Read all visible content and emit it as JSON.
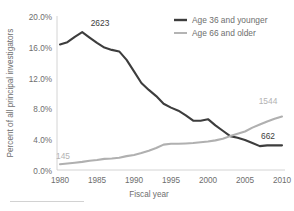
{
  "chart_data": {
    "type": "line",
    "title": "",
    "xlabel": "Fiscal year",
    "ylabel": "Percent of all principal investigators",
    "xlim": [
      1980,
      2010
    ],
    "ylim": [
      0,
      20
    ],
    "grid": false,
    "legend_position": "top-right",
    "x_ticks": [
      "1980",
      "1985",
      "1990",
      "1995",
      "2000",
      "2005",
      "2010"
    ],
    "y_ticks": [
      "0.0%",
      "4.0%",
      "8.0%",
      "12.0%",
      "16.0%",
      "20.0%"
    ],
    "x": [
      1980,
      1981,
      1982,
      1983,
      1984,
      1985,
      1986,
      1987,
      1988,
      1989,
      1990,
      1991,
      1992,
      1993,
      1994,
      1995,
      1996,
      1997,
      1998,
      1999,
      2000,
      2001,
      2002,
      2003,
      2004,
      2005,
      2006,
      2007,
      2008,
      2009,
      2010
    ],
    "series": [
      {
        "name": "Age 36 and younger",
        "color": "#3d3d3d",
        "values": [
          16.3,
          16.6,
          17.3,
          17.9,
          17.2,
          16.5,
          15.9,
          15.6,
          15.4,
          14.3,
          12.8,
          11.3,
          10.4,
          9.6,
          8.6,
          8.1,
          7.7,
          7.1,
          6.4,
          6.4,
          6.6,
          5.8,
          5.1,
          4.4,
          4.2,
          3.9,
          3.5,
          3.1,
          3.2,
          3.2,
          3.2
        ],
        "end_label": "662",
        "peak_label": "2623"
      },
      {
        "name": "Age 66 and older",
        "color": "#b0b0b0",
        "values": [
          0.75,
          0.85,
          0.95,
          1.05,
          1.2,
          1.3,
          1.45,
          1.5,
          1.6,
          1.8,
          1.95,
          2.2,
          2.5,
          2.85,
          3.3,
          3.4,
          3.4,
          3.45,
          3.5,
          3.6,
          3.7,
          3.85,
          4.05,
          4.4,
          4.7,
          5.0,
          5.5,
          5.9,
          6.3,
          6.65,
          6.95
        ],
        "start_label": "145",
        "end_label": "1544"
      }
    ],
    "annotations": [
      {
        "text": "2623",
        "series": "Age 36 and younger",
        "kind": "peak",
        "color": "#3d3d3d"
      },
      {
        "text": "662",
        "series": "Age 36 and younger",
        "kind": "end",
        "color": "#3d3d3d"
      },
      {
        "text": "145",
        "series": "Age 66 and older",
        "kind": "start",
        "color": "#b3b3b3"
      },
      {
        "text": "1544",
        "series": "Age 66 and older",
        "kind": "end",
        "color": "#b3b3b3"
      }
    ]
  },
  "legend": {
    "items": [
      {
        "label": "Age 36 and younger",
        "color": "#3d3d3d"
      },
      {
        "label": "Age 66 and older",
        "color": "#b0b0b0"
      }
    ]
  },
  "axes": {
    "x_title": "Fiscal year",
    "y_title": "Percent of all principal investigators"
  }
}
